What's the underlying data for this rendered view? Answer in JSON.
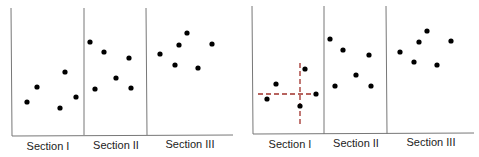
{
  "panels": [
    {
      "id": "left",
      "sections": [
        {
          "label": "Section I",
          "points": [
            [
              27,
              102
            ],
            [
              37,
              87
            ],
            [
              65,
              72
            ],
            [
              60,
              108
            ],
            [
              76,
              97
            ]
          ]
        },
        {
          "label": "Section II",
          "points": [
            [
              90,
              42
            ],
            [
              104,
              52
            ],
            [
              129,
              58
            ],
            [
              116,
              78
            ],
            [
              95,
              89
            ],
            [
              131,
              88
            ]
          ]
        },
        {
          "label": "Section III",
          "points": [
            [
              160,
              54
            ],
            [
              175,
              65
            ],
            [
              179,
              45
            ],
            [
              187,
              33
            ],
            [
              198,
              68
            ],
            [
              212,
              44
            ]
          ]
        }
      ],
      "crosshair": null
    },
    {
      "id": "right",
      "sections": [
        {
          "label": "Section I",
          "points": [
            [
              267,
              99
            ],
            [
              276,
              84
            ],
            [
              305,
              69
            ],
            [
              300,
              106
            ],
            [
              316,
              94
            ]
          ]
        },
        {
          "label": "Section II",
          "points": [
            [
              330,
              39
            ],
            [
              343,
              50
            ],
            [
              369,
              55
            ],
            [
              356,
              75
            ],
            [
              335,
              86
            ],
            [
              371,
              86
            ]
          ]
        },
        {
          "label": "Section III",
          "points": [
            [
              400,
              52
            ],
            [
              414,
              62
            ],
            [
              419,
              42
            ],
            [
              427,
              31
            ],
            [
              437,
              65
            ],
            [
              451,
              41
            ]
          ]
        }
      ],
      "crosshair": {
        "x": 300,
        "y": 94,
        "color": "#a0302a"
      }
    }
  ],
  "labels": {
    "left_s1": "Section I",
    "left_s2": "Section II",
    "left_s3": "Section III",
    "right_s1": "Section I",
    "right_s2": "Section II",
    "right_s3": "Section III"
  }
}
